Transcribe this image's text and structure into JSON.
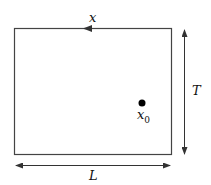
{
  "diagram": {
    "labels": {
      "top": "x",
      "right": "T",
      "bottom": "L",
      "point_main": "x",
      "point_sub": "0"
    },
    "colors": {
      "stroke": "#333333",
      "dot": "#000000"
    }
  }
}
